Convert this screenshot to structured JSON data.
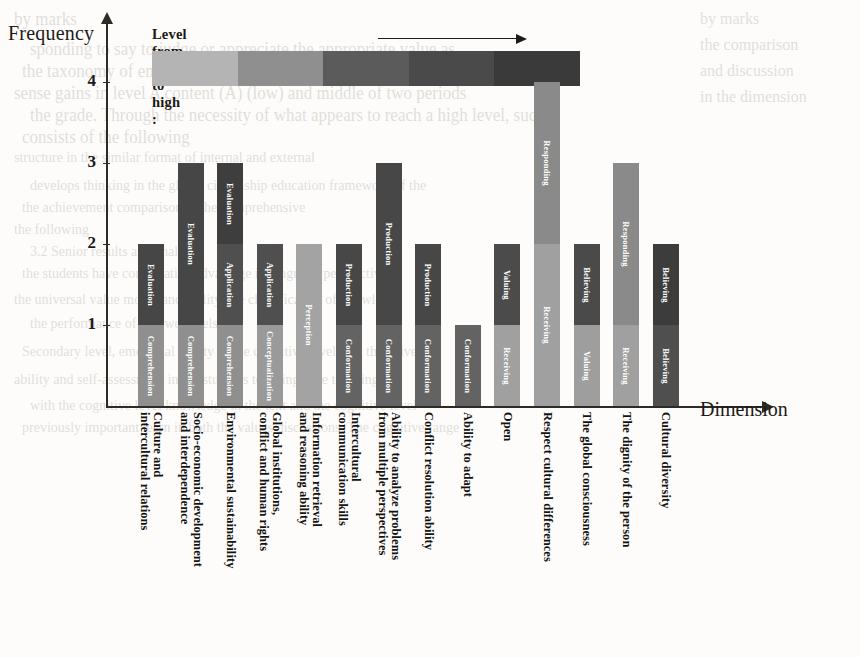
{
  "legend": {
    "title": "Level from low to high :",
    "arrow_icon": "right-arrow-icon",
    "swatches": [
      "#b4b4b4",
      "#8f8f8f",
      "#5b5b5b",
      "#4a4a4a",
      "#3a3a3a"
    ]
  },
  "axes": {
    "y_title": "Frequency",
    "x_title": "Dimension",
    "y_ticks": [
      "4",
      "3",
      "2",
      "1"
    ]
  },
  "background_bleed": [
    "by marks",
    "sponding to say to judge or appreciate the appropriate value as",
    "the taxonomy of emotional structure in the relevant content, i.e.",
    "sense gains in level A content (A) (low) and middle of two periods",
    "the grade. Through the necessity of what appears to reach a high level, such",
    "consists of the following",
    "structure in the similar format of internal and external",
    "develops thinking in the global citizenship education framework of the",
    "the achievement comparison in the comprehensive",
    "the following",
    "3.2 Senior results and analysis",
    "the students have comparative advantage in language perspectives",
    "the universal value model and ability, the classification of knowledge",
    "the performance of the two levels.",
    "Secondary level, emotional ability of the cognitive level is at their five",
    "ability and self-assessment in the students teaching. The teaching can",
    "with the cognitive level knowledge in the text and the cognitive level",
    "previously important learn in both the values discussions. The cognitive range"
  ],
  "chart_data": {
    "type": "bar",
    "stacked": true,
    "title": "",
    "xlabel": "Dimension",
    "ylabel": "Frequency",
    "ylim": [
      0,
      4.5
    ],
    "y_ticks": [
      1,
      2,
      3,
      4
    ],
    "grid": false,
    "legend_position": "top",
    "categories": [
      "Culture and intercultural relations",
      "Socio-economic development and interdependence",
      "Environmental sustainability",
      "Global institutions, conflict and human rights",
      "Information retrieval and reasoning ability",
      "Intercultural communication skills",
      "Ability to analyze problems from multiple perspectives",
      "Conflict resolution ability",
      "Ability to adapt",
      "Open",
      "Respect cultural differences",
      "The global consciousness",
      "The dignity of the person",
      "Cultural diversity"
    ],
    "totals": [
      2,
      3,
      3,
      2,
      2,
      2,
      3,
      2,
      1,
      2,
      4,
      2,
      3,
      2
    ],
    "bars": [
      {
        "category": "Culture and intercultural relations",
        "total": 2,
        "segments": [
          {
            "label": "Comprehension",
            "value": 1,
            "color": "#8f8f8f"
          },
          {
            "label": "Evaluation",
            "value": 1,
            "color": "#464646"
          }
        ]
      },
      {
        "category": "Socio-economic development and interdependence",
        "total": 3,
        "segments": [
          {
            "label": "Comprehension",
            "value": 1,
            "color": "#8f8f8f"
          },
          {
            "label": "Evaluation",
            "value": 2,
            "color": "#464646"
          }
        ]
      },
      {
        "category": "Environmental sustainability",
        "total": 3,
        "segments": [
          {
            "label": "Comprehension",
            "value": 1,
            "color": "#8f8f8f"
          },
          {
            "label": "Application",
            "value": 1,
            "color": "#4f4f4f"
          },
          {
            "label": "Evaluation",
            "value": 1,
            "color": "#3e3e3e"
          }
        ]
      },
      {
        "category": "Global institutions, conflict and human rights",
        "total": 2,
        "segments": [
          {
            "label": "Conceptualization",
            "value": 1,
            "color": "#9a9a9a"
          },
          {
            "label": "Application",
            "value": 1,
            "color": "#4f4f4f"
          }
        ]
      },
      {
        "category": "Information retrieval and reasoning ability",
        "total": 2,
        "segments": [
          {
            "label": "Perception",
            "value": 2,
            "color": "#a3a3a3"
          }
        ]
      },
      {
        "category": "Intercultural communication skills",
        "total": 2,
        "segments": [
          {
            "label": "Conformation",
            "value": 1,
            "color": "#636363"
          },
          {
            "label": "Production",
            "value": 1,
            "color": "#474747"
          }
        ]
      },
      {
        "category": "Ability to analyze problems from multiple perspectives",
        "total": 3,
        "segments": [
          {
            "label": "Conformation",
            "value": 1,
            "color": "#636363"
          },
          {
            "label": "Production",
            "value": 2,
            "color": "#474747"
          }
        ]
      },
      {
        "category": "Conflict resolution ability",
        "total": 2,
        "segments": [
          {
            "label": "Conformation",
            "value": 1,
            "color": "#636363"
          },
          {
            "label": "Production",
            "value": 1,
            "color": "#474747"
          }
        ]
      },
      {
        "category": "Ability to adapt",
        "total": 1,
        "segments": [
          {
            "label": "Conformation",
            "value": 1,
            "color": "#636363"
          }
        ]
      },
      {
        "category": "Open",
        "total": 2,
        "segments": [
          {
            "label": "Receiving",
            "value": 1,
            "color": "#a0a0a0"
          },
          {
            "label": "Valuing",
            "value": 1,
            "color": "#4b4b4b"
          }
        ]
      },
      {
        "category": "Respect cultural differences",
        "total": 4,
        "segments": [
          {
            "label": "Receiving",
            "value": 2,
            "color": "#a0a0a0"
          },
          {
            "label": "Responding",
            "value": 2,
            "color": "#8a8a8a"
          }
        ]
      },
      {
        "category": "The global consciousness",
        "total": 2,
        "segments": [
          {
            "label": "Valuing",
            "value": 1,
            "color": "#9e9e9e"
          },
          {
            "label": "Believing",
            "value": 1,
            "color": "#4a4a4a"
          }
        ]
      },
      {
        "category": "The dignity of the person",
        "total": 3,
        "segments": [
          {
            "label": "Receiving",
            "value": 1,
            "color": "#a0a0a0"
          },
          {
            "label": "Responding",
            "value": 2,
            "color": "#8a8a8a"
          }
        ]
      },
      {
        "category": "Cultural diversity",
        "total": 2,
        "segments": [
          {
            "label": "Believing",
            "value": 1,
            "color": "#4f4f4f"
          },
          {
            "label": "Believing",
            "value": 1,
            "color": "#3c3c3c"
          }
        ]
      }
    ]
  }
}
